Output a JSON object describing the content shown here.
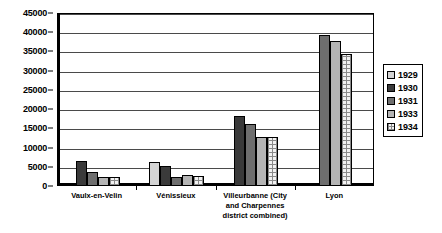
{
  "chart_data": {
    "type": "bar",
    "title": "",
    "subtitle": "",
    "xlabel": "",
    "ylabel": "",
    "ylim": [
      0,
      45000
    ],
    "yticks": [
      0,
      5000,
      10000,
      15000,
      20000,
      25000,
      30000,
      35000,
      40000,
      45000
    ],
    "ytick_labels": [
      "0",
      "5000",
      "10000",
      "15000",
      "20000",
      "25000",
      "30000",
      "35000",
      "40000",
      "45000"
    ],
    "grid": true,
    "legend_position": "right",
    "categories": [
      "Vaulx-en-Velin",
      "Vénissieux",
      "Villeurbanne (City and Charpennes district combined)",
      "Lyon"
    ],
    "series": [
      {
        "name": "1929",
        "values": [
          null,
          6100,
          null,
          null
        ]
      },
      {
        "name": "1930",
        "values": [
          6200,
          4900,
          18000,
          null
        ]
      },
      {
        "name": "1931",
        "values": [
          3500,
          2000,
          16000,
          39000
        ]
      },
      {
        "name": "1933",
        "values": [
          2200,
          2700,
          12400,
          37500
        ]
      },
      {
        "name": "1934",
        "values": [
          2000,
          2400,
          12600,
          34000
        ]
      }
    ],
    "legend_entries": [
      "1929",
      "1930",
      "1931",
      "1933",
      "1934"
    ]
  },
  "axis": {
    "y_ticks": [
      {
        "label": "45000",
        "value": 45000
      },
      {
        "label": "40000",
        "value": 40000
      },
      {
        "label": "35000",
        "value": 35000
      },
      {
        "label": "30000",
        "value": 30000
      },
      {
        "label": "25000",
        "value": 25000
      },
      {
        "label": "20000",
        "value": 20000
      },
      {
        "label": "15000",
        "value": 15000
      },
      {
        "label": "10000",
        "value": 10000
      },
      {
        "label": "5000",
        "value": 5000
      },
      {
        "label": "0",
        "value": 0
      }
    ]
  },
  "categories_display": [
    {
      "lines": [
        "Vaulx-en-Velin"
      ]
    },
    {
      "lines": [
        "Vénissieux"
      ]
    },
    {
      "lines": [
        "Villeurbanne (City",
        "and Charpennes",
        "district combined)"
      ]
    },
    {
      "lines": [
        "Lyon"
      ]
    }
  ],
  "colors": {
    "s1929": "#d4d4d4",
    "s1930": "#3a3a3a",
    "s1931": "#6e6e6e",
    "s1933": "#b4b4b4",
    "s1934": "#f2f2f2",
    "axis": "#000000",
    "grid": "#4a4a4a",
    "background": "#ffffff"
  }
}
